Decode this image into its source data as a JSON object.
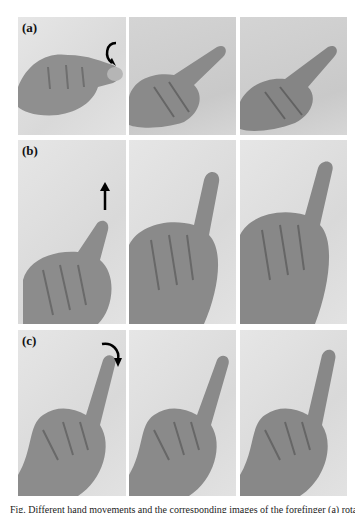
{
  "figure": {
    "rows": [
      {
        "label": "(a)",
        "motion": "rotation",
        "arrow": "curved-rotate-arrow",
        "panels": 3
      },
      {
        "label": "(b)",
        "motion": "upward",
        "arrow": "up-arrow",
        "panels": 3
      },
      {
        "label": "(c)",
        "motion": "bend-down",
        "arrow": "curved-down-arrow",
        "panels": 3
      }
    ],
    "caption": "Fig. Different hand movements and the corresponding images of the forefinger (a) rotation (b) lifting (c) bending"
  }
}
